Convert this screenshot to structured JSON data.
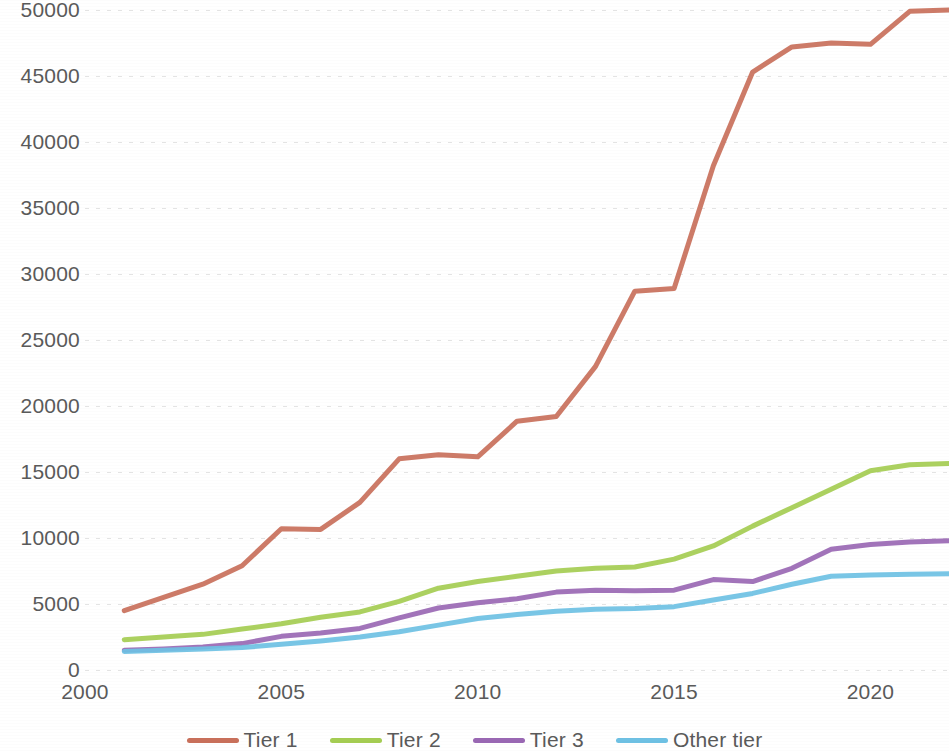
{
  "chart_data": {
    "type": "line",
    "title": "",
    "subtitle": "",
    "xlabel": "",
    "ylabel": "",
    "xlim": [
      2000,
      2022
    ],
    "ylim": [
      0,
      50000
    ],
    "ytick_step": 5000,
    "grid": true,
    "legend_position": "bottom",
    "x_ticks": [
      "2000",
      "2005",
      "2010",
      "2015",
      "2020"
    ],
    "x_tick_values": [
      2000,
      2005,
      2010,
      2015,
      2020
    ],
    "y_ticks": [
      "0",
      "5000",
      "10000",
      "15000",
      "20000",
      "25000",
      "30000",
      "35000",
      "40000",
      "45000",
      "50000"
    ],
    "y_tick_values": [
      0,
      5000,
      10000,
      15000,
      20000,
      25000,
      30000,
      35000,
      40000,
      45000,
      50000
    ],
    "x": [
      2001,
      2002,
      2003,
      2004,
      2005,
      2006,
      2007,
      2008,
      2009,
      2010,
      2011,
      2012,
      2013,
      2014,
      2015,
      2016,
      2017,
      2018,
      2019,
      2020,
      2021,
      2022
    ],
    "series": [
      {
        "name": "Tier 1",
        "color": "#C9705B",
        "values": [
          4500,
          5500,
          6500,
          7900,
          10700,
          10650,
          12700,
          16000,
          16300,
          16150,
          18850,
          19200,
          23000,
          28700,
          28900,
          38200,
          45300,
          47200,
          47500,
          47400,
          49900,
          50000
        ]
      },
      {
        "name": "Tier 2",
        "color": "#A5CD53",
        "values": [
          2300,
          2500,
          2700,
          3100,
          3500,
          4000,
          4400,
          5200,
          6200,
          6700,
          7100,
          7500,
          7700,
          7800,
          8400,
          9400,
          10900,
          12300,
          13700,
          15100,
          15550,
          15650
        ]
      },
      {
        "name": "Tier 3",
        "color": "#9A68B4",
        "values": [
          1500,
          1600,
          1750,
          2000,
          2550,
          2800,
          3150,
          3950,
          4700,
          5100,
          5400,
          5900,
          6050,
          6000,
          6050,
          6850,
          6700,
          7700,
          9150,
          9500,
          9700,
          9800
        ]
      },
      {
        "name": "Other tier",
        "color": "#6EC1E4",
        "values": [
          1400,
          1500,
          1600,
          1700,
          1950,
          2200,
          2500,
          2900,
          3400,
          3900,
          4200,
          4450,
          4600,
          4650,
          4800,
          5300,
          5800,
          6500,
          7100,
          7200,
          7250,
          7300
        ]
      }
    ]
  },
  "legend": {
    "items": [
      {
        "label": "Tier 1",
        "color": "#C9705B"
      },
      {
        "label": "Tier 2",
        "color": "#A5CD53"
      },
      {
        "label": "Tier 3",
        "color": "#9A68B4"
      },
      {
        "label": "Other tier",
        "color": "#6EC1E4"
      }
    ]
  }
}
